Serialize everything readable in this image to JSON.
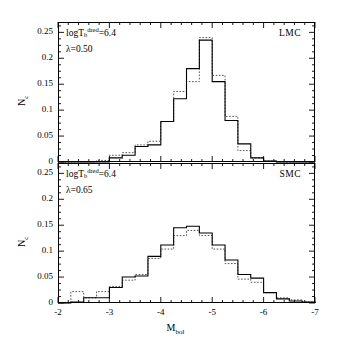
{
  "figure": {
    "xlabel": "M_bol",
    "xlabel_base": "M",
    "xlabel_sub": "bol",
    "ylabel": "N_c",
    "ylabel_base": "N",
    "ylabel_sub": "c"
  },
  "axis": {
    "x_ticks": [
      "-2",
      "-3",
      "-4",
      "-5",
      "-6",
      "-7"
    ],
    "x_tick_values": [
      -2,
      -3,
      -4,
      -5,
      -6,
      -7
    ],
    "y_ticks": [
      "0",
      "0.05",
      "0.1",
      "0.15",
      "0.2",
      "0.25"
    ],
    "y_tick_values": [
      0,
      0.05,
      0.1,
      0.15,
      0.2,
      0.25
    ],
    "x_minor_step": 0.2,
    "y_minor_step": 0.0125
  },
  "chart_data": {
    "type": "line",
    "title": "",
    "xlabel": "M_bol",
    "ylabel": "N_c",
    "xlim": [
      -2,
      -7
    ],
    "ylim": [
      0,
      0.27
    ],
    "grid": false,
    "legend": "none",
    "bin_width": 0.25,
    "panels": [
      {
        "name": "LMC",
        "label": "LMC",
        "annotations": [
          {
            "text": "logT_b^dred=6.4",
            "base": "logT",
            "sub": "b",
            "sup": "dred",
            "value": "=6.4"
          },
          {
            "text": "λ=0.50",
            "symbol": "λ",
            "value": "0.50"
          }
        ],
        "bin_edges": [
          -2.0,
          -2.25,
          -2.5,
          -2.75,
          -3.0,
          -3.25,
          -3.5,
          -3.75,
          -4.0,
          -4.25,
          -4.5,
          -4.75,
          -5.0,
          -5.25,
          -5.5,
          -5.75,
          -6.0,
          -6.25,
          -6.5,
          -6.75,
          -7.0
        ],
        "series": [
          {
            "name": "solid",
            "style": "solid",
            "values": [
              0.0,
              0.0,
              0.0,
              0.0,
              0.008,
              0.013,
              0.03,
              0.033,
              0.078,
              0.122,
              0.18,
              0.235,
              0.155,
              0.08,
              0.035,
              0.008,
              0.002,
              0.0,
              0.0,
              0.0
            ]
          },
          {
            "name": "dotted",
            "style": "dotted",
            "values": [
              0.0,
              0.0,
              0.0,
              0.003,
              0.013,
              0.018,
              0.033,
              0.04,
              0.078,
              0.136,
              0.155,
              0.24,
              0.167,
              0.088,
              0.022,
              0.008,
              0.002,
              0.0,
              0.0,
              0.0
            ]
          }
        ]
      },
      {
        "name": "SMC",
        "label": "SMC",
        "annotations": [
          {
            "text": "logT_b^dred=6.4",
            "base": "logT",
            "sub": "b",
            "sup": "dred",
            "value": "=6.4"
          },
          {
            "text": "λ=0.65",
            "symbol": "λ",
            "value": "0.65"
          }
        ],
        "bin_edges": [
          -2.0,
          -2.25,
          -2.5,
          -2.75,
          -3.0,
          -3.25,
          -3.5,
          -3.75,
          -4.0,
          -4.25,
          -4.5,
          -4.75,
          -5.0,
          -5.25,
          -5.5,
          -5.75,
          -6.0,
          -6.25,
          -6.5,
          -6.75,
          -7.0
        ],
        "series": [
          {
            "name": "solid",
            "style": "solid",
            "values": [
              0.0,
              0.002,
              0.01,
              0.01,
              0.03,
              0.05,
              0.052,
              0.09,
              0.112,
              0.145,
              0.148,
              0.135,
              0.112,
              0.083,
              0.055,
              0.048,
              0.02,
              0.008,
              0.004,
              0.002
            ]
          },
          {
            "name": "dotted",
            "style": "dotted",
            "values": [
              0.0,
              0.022,
              0.01,
              0.022,
              0.032,
              0.044,
              0.055,
              0.086,
              0.104,
              0.13,
              0.14,
              0.13,
              0.104,
              0.076,
              0.046,
              0.04,
              0.02,
              0.01,
              0.006,
              0.002
            ]
          }
        ]
      }
    ]
  },
  "colors": {
    "axis": "#000000",
    "solid_curve": "#000000",
    "dotted_curve": "#555555",
    "background": "#ffffff"
  }
}
